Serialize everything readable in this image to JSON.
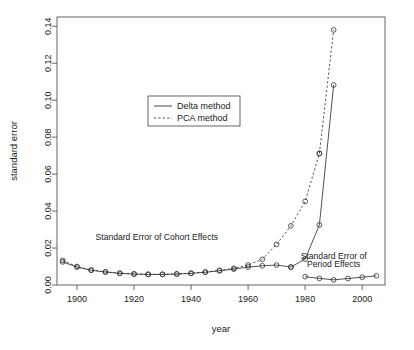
{
  "chart_data": {
    "type": "line",
    "title": "",
    "xlabel": "year",
    "ylabel": "standard error",
    "xlim": [
      1893,
      2008
    ],
    "ylim": [
      0.0,
      0.145
    ],
    "xticks": [
      1900,
      1920,
      1940,
      1960,
      1980,
      2000
    ],
    "xtick_labels": [
      "1900",
      "1920",
      "1940",
      "1960",
      "1980",
      "2000"
    ],
    "yticks": [
      0.0,
      0.02,
      0.04,
      0.06,
      0.08,
      0.1,
      0.12,
      0.14
    ],
    "ytick_labels": [
      "0.00",
      "0.02",
      "0.04",
      "0.06",
      "0.08",
      "0.10",
      "0.12",
      "0.14"
    ],
    "grid": false,
    "legend_position": "upper-center-left",
    "legend": [
      {
        "label": "Delta method",
        "style": "solid"
      },
      {
        "label": "PCA method",
        "style": "dashed"
      }
    ],
    "annotations": [
      {
        "text": "Standard Error of Cohort Effects",
        "x": 1928,
        "y": 0.0245
      },
      {
        "text": "Standard Error of",
        "x": 1990,
        "y": 0.0138
      },
      {
        "text": "Period Effects",
        "x": 1990,
        "y": 0.0098
      }
    ],
    "series": [
      {
        "name": "Cohort Effects - Delta method",
        "style": "solid",
        "marker": "circle",
        "x": [
          1895,
          1900,
          1905,
          1910,
          1915,
          1920,
          1925,
          1930,
          1935,
          1940,
          1945,
          1950,
          1955,
          1960,
          1965,
          1970,
          1975
        ],
        "y": [
          0.0125,
          0.0097,
          0.008,
          0.007,
          0.0063,
          0.0059,
          0.0057,
          0.0057,
          0.0059,
          0.0063,
          0.0069,
          0.0077,
          0.0086,
          0.0097,
          0.0104,
          0.0108,
          0.0097
        ]
      },
      {
        "name": "Cohort Effects - PCA method",
        "style": "dashed",
        "marker": "circle",
        "x": [
          1895,
          1900,
          1905,
          1910,
          1915,
          1920,
          1925,
          1930,
          1935,
          1940,
          1945,
          1950,
          1955,
          1960,
          1965,
          1970,
          1975,
          1980,
          1985
        ],
        "y": [
          0.0133,
          0.01,
          0.0081,
          0.0071,
          0.0064,
          0.006,
          0.0058,
          0.0058,
          0.006,
          0.0064,
          0.007,
          0.0079,
          0.009,
          0.0108,
          0.0139,
          0.022,
          0.032,
          0.0452,
          0.0712
        ]
      },
      {
        "name": "PCA peak segment",
        "style": "dashed",
        "marker": "circle",
        "x": [
          1985,
          1990
        ],
        "y": [
          0.0712,
          0.138
        ]
      },
      {
        "name": "Delta rise segment",
        "style": "solid",
        "marker": "circle",
        "x": [
          1975,
          1980,
          1985,
          1990
        ],
        "y": [
          0.0097,
          0.014,
          0.0325,
          0.1082
        ]
      },
      {
        "name": "Period Effects",
        "style": "solid",
        "marker": "circle",
        "x": [
          1980,
          1985,
          1990,
          1995,
          2000,
          2005
        ],
        "y": [
          0.0045,
          0.0036,
          0.0028,
          0.0035,
          0.0042,
          0.005
        ]
      }
    ]
  },
  "axes": {
    "ylabel": "standard error",
    "xlabel": "year"
  },
  "legend": {
    "items": [
      {
        "label": "Delta method"
      },
      {
        "label": "PCA method"
      }
    ]
  },
  "annotations": {
    "cohort": "Standard Error of Cohort Effects",
    "period_line1": "Standard Error of",
    "period_line2": "Period Effects"
  },
  "ticks": {
    "x": [
      "1900",
      "1920",
      "1940",
      "1960",
      "1980",
      "2000"
    ],
    "y": [
      "0.00",
      "0.02",
      "0.04",
      "0.06",
      "0.08",
      "0.10",
      "0.12",
      "0.14"
    ]
  },
  "colors": {
    "line": "#333333",
    "axis": "#555555",
    "text": "#1a1a1a",
    "background": "#ffffff"
  }
}
